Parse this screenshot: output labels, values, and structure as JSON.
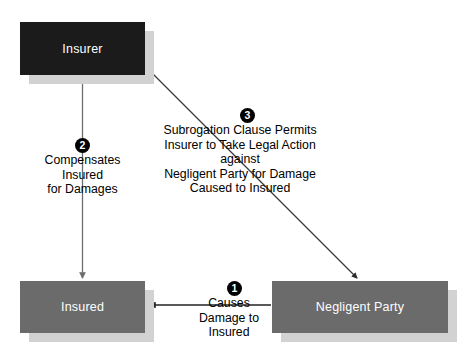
{
  "diagram": {
    "background_color": "#ffffff",
    "nodes": [
      {
        "id": "insurer",
        "label": "Insurer",
        "fill": "#1b1b1b",
        "text_color": "#ffffff",
        "shadow_color": "#d2d2d2",
        "x": 20,
        "y": 22,
        "w": 125,
        "h": 53
      },
      {
        "id": "insured",
        "label": "Insured",
        "fill": "#6b6b6b",
        "text_color": "#ffffff",
        "shadow_color": "#d2d2d2",
        "x": 20,
        "y": 281,
        "w": 125,
        "h": 52
      },
      {
        "id": "negligent-party",
        "label": "Negligent Party",
        "fill": "#6b6b6b",
        "text_color": "#ffffff",
        "shadow_color": "#d2d2d2",
        "x": 272,
        "y": 281,
        "w": 176,
        "h": 52
      }
    ],
    "steps": [
      {
        "number": "1",
        "text": "Causes\nDamage to\nInsured",
        "badge_x": 227,
        "badge_y": 281,
        "label_x": 184,
        "label_y": 296,
        "label_w": 90
      },
      {
        "number": "2",
        "text": "Compensates\nInsured\nfor Damages",
        "badge_x": 75,
        "badge_y": 138,
        "label_x": 30,
        "label_y": 153,
        "label_w": 105
      },
      {
        "number": "3",
        "text": "Subrogation Clause Permits\nInsurer to Take Legal Action against\nNegligent Party for Damage\nCaused to Insured",
        "badge_x": 240,
        "badge_y": 108,
        "label_x": 155,
        "label_y": 123,
        "label_w": 170
      }
    ],
    "edges": [
      {
        "id": "insurer-to-insured",
        "from": "insurer",
        "to": "insured",
        "color": "#6d6d6d",
        "style": "vertical-arrow"
      },
      {
        "id": "negligent-to-insured",
        "from": "negligent-party",
        "to": "insured",
        "color": "#222222",
        "style": "horizontal-arrow"
      },
      {
        "id": "insurer-to-negligent",
        "from": "insurer",
        "to": "negligent-party",
        "color": "#3a3a3a",
        "style": "diagonal-arrow"
      }
    ]
  }
}
